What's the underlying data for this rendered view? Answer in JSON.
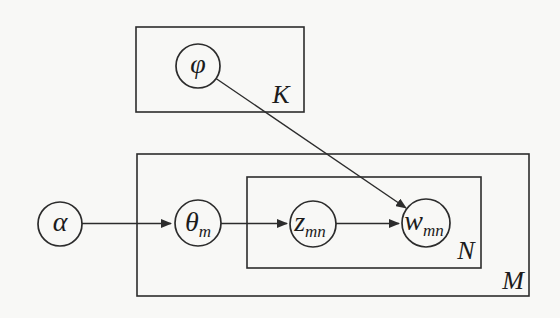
{
  "diagram": {
    "kind": "plate-notation-graphical-model",
    "nodes": [
      {
        "id": "alpha",
        "label": "α",
        "sub": "",
        "observed": false
      },
      {
        "id": "phi",
        "label": "φ",
        "sub": "",
        "observed": false
      },
      {
        "id": "theta_m",
        "label": "θ",
        "sub": "m",
        "observed": false
      },
      {
        "id": "z_mn",
        "label": "z",
        "sub": "mn",
        "observed": false
      },
      {
        "id": "w_mn",
        "label": "w",
        "sub": "mn",
        "observed": true
      }
    ],
    "plates": [
      {
        "id": "K",
        "label": "K"
      },
      {
        "id": "N",
        "label": "N"
      },
      {
        "id": "M",
        "label": "M"
      }
    ],
    "edges": [
      {
        "from": "alpha",
        "to": "theta_m"
      },
      {
        "from": "theta_m",
        "to": "z_mn"
      },
      {
        "from": "z_mn",
        "to": "w_mn"
      },
      {
        "from": "phi",
        "to": "w_mn"
      }
    ],
    "colors": {
      "stroke": "#2c2c2c",
      "shaded_node_fill": "#c3c3c3",
      "background": "#f8f8f6"
    }
  }
}
